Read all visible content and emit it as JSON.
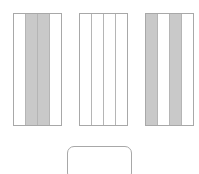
{
  "diagram": {
    "background_color": "#ffffff",
    "border_color": "#a8a8a8",
    "divider_color": "#b5b5b5",
    "shaded_color": "#c9c9c9",
    "unshaded_color": "#ffffff",
    "panels": [
      {
        "id": "panel-1",
        "x": 13,
        "y": 13,
        "width": 49,
        "height": 113,
        "shape": "rectangle",
        "column_count": 4,
        "columns": [
          {
            "index": 1,
            "shaded": false
          },
          {
            "index": 2,
            "shaded": true
          },
          {
            "index": 3,
            "shaded": true
          },
          {
            "index": 4,
            "shaded": false
          }
        ]
      },
      {
        "id": "panel-2",
        "x": 79,
        "y": 13,
        "width": 49,
        "height": 113,
        "shape": "rectangle",
        "column_count": 4,
        "columns": [
          {
            "index": 1,
            "shaded": false
          },
          {
            "index": 2,
            "shaded": false
          },
          {
            "index": 3,
            "shaded": false
          },
          {
            "index": 4,
            "shaded": false
          }
        ]
      },
      {
        "id": "panel-3",
        "x": 145,
        "y": 13,
        "width": 49,
        "height": 113,
        "shape": "rectangle",
        "column_count": 4,
        "columns": [
          {
            "index": 1,
            "shaded": true
          },
          {
            "index": 2,
            "shaded": false
          },
          {
            "index": 3,
            "shaded": true
          },
          {
            "index": 4,
            "shaded": false
          }
        ]
      }
    ],
    "rounded_panel": {
      "id": "panel-4",
      "x": 67,
      "y": 146,
      "width": 65,
      "height": 34,
      "shape": "rounded-rectangle",
      "corner_radius": 7,
      "column_count": 0,
      "shaded": false,
      "clipped_at_bottom": true
    }
  }
}
